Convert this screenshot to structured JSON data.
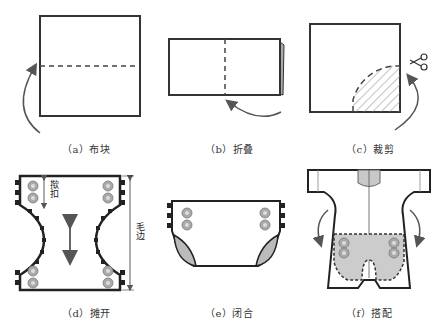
{
  "figure": {
    "panels": [
      {
        "id": "a",
        "caption": "（a）布块",
        "description": "square cloth with horizontal dashed fold line and curved arrow"
      },
      {
        "id": "b",
        "caption": "（b）折叠",
        "description": "folded rectangle with vertical dashed line and curved arrow"
      },
      {
        "id": "c",
        "caption": "（c）裁剪",
        "description": "square with hatched quarter-circle cut area, scissors and arrow"
      },
      {
        "id": "d",
        "caption": "（d）摊开",
        "description": "unfolded diaper shape with snap buttons and double arrow"
      },
      {
        "id": "e",
        "caption": "（e）闭合",
        "description": "closed diaper with snap buttons"
      },
      {
        "id": "f",
        "caption": "（f）搭配",
        "description": "baby romper with diaper dashed outline inside"
      }
    ],
    "annotations": {
      "snap_label": "揿扣",
      "edge_label": "毛边"
    },
    "colors": {
      "line": "#222222",
      "arrow": "#555555",
      "fill_gray": "#c8c8c8",
      "button": "#999999"
    }
  }
}
